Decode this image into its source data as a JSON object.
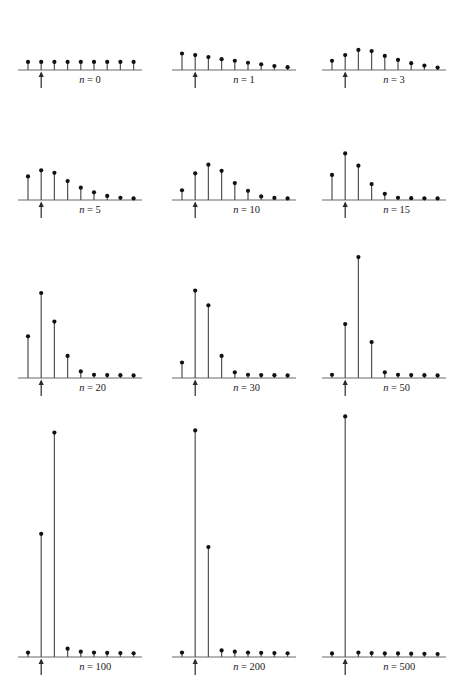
{
  "figure": {
    "type": "stem-plot-grid",
    "rows": 4,
    "columns": 3,
    "background_color": "#ffffff",
    "stem_color": "#55555a",
    "dot_color": "#111111",
    "axis_color": "#6b6b6b",
    "arrow_color": "#2b2b2b",
    "marker_symbol": "up-arrow",
    "marker_index": 1,
    "label_template": "n = {value}"
  },
  "chart_data": {
    "type": "bar",
    "title": "",
    "xlabel": "",
    "ylabel": "",
    "grid": false,
    "legend": null,
    "shared_x_count": 9,
    "panels": [
      {
        "id": "panel-n-0",
        "label": "n = 0",
        "label_var": "n",
        "label_value": "0",
        "row": 1,
        "col": 1,
        "categories": [
          0,
          1,
          2,
          3,
          4,
          5,
          6,
          7,
          8
        ],
        "values": [
          1,
          1,
          1,
          1,
          1,
          1,
          1,
          1,
          1
        ],
        "ylim": [
          0,
          8.2
        ],
        "marker_index": 1
      },
      {
        "id": "panel-n-1",
        "label": "n = 1",
        "label_var": "n",
        "label_value": "1",
        "row": 1,
        "col": 2,
        "categories": [
          0,
          1,
          2,
          3,
          4,
          5,
          6,
          7,
          8
        ],
        "values": [
          2.05,
          1.85,
          1.6,
          1.35,
          1.15,
          0.9,
          0.7,
          0.5,
          0.35
        ],
        "ylim": [
          0,
          8.2
        ],
        "marker_index": 1
      },
      {
        "id": "panel-n-3",
        "label": "n = 3",
        "label_var": "n",
        "label_value": "3",
        "row": 1,
        "col": 3,
        "categories": [
          0,
          1,
          2,
          3,
          4,
          5,
          6,
          7,
          8
        ],
        "values": [
          1.15,
          1.85,
          2.5,
          2.35,
          1.75,
          1.25,
          0.85,
          0.55,
          0.3
        ],
        "ylim": [
          0,
          8.2
        ],
        "marker_index": 1
      },
      {
        "id": "panel-n-5",
        "label": "n = 5",
        "label_var": "n",
        "label_value": "5",
        "row": 2,
        "col": 1,
        "categories": [
          0,
          1,
          2,
          3,
          4,
          5,
          6,
          7,
          8
        ],
        "values": [
          2.3,
          2.9,
          2.65,
          1.85,
          1.2,
          0.75,
          0.4,
          0.22,
          0.15
        ],
        "ylim": [
          0,
          8.2
        ],
        "marker_index": 1
      },
      {
        "id": "panel-n-10",
        "label": "n = 10",
        "label_var": "n",
        "label_value": "10",
        "row": 2,
        "col": 2,
        "categories": [
          0,
          1,
          2,
          3,
          4,
          5,
          6,
          7,
          8
        ],
        "values": [
          0.95,
          2.6,
          3.45,
          2.85,
          1.65,
          0.9,
          0.35,
          0.2,
          0.15
        ],
        "ylim": [
          0,
          8.2
        ],
        "marker_index": 1
      },
      {
        "id": "panel-n-15",
        "label": "n = 15",
        "label_var": "n",
        "label_value": "15",
        "row": 2,
        "col": 3,
        "categories": [
          0,
          1,
          2,
          3,
          4,
          5,
          6,
          7,
          8
        ],
        "values": [
          2.45,
          4.55,
          3.35,
          1.55,
          0.6,
          0.22,
          0.18,
          0.16,
          0.15
        ],
        "ylim": [
          0,
          8.2
        ],
        "marker_index": 1
      },
      {
        "id": "panel-n-20",
        "label": "n = 20",
        "label_var": "n",
        "label_value": "20",
        "row": 3,
        "col": 1,
        "categories": [
          0,
          1,
          2,
          3,
          4,
          5,
          6,
          7,
          8
        ],
        "values": [
          2.55,
          5.2,
          3.45,
          1.35,
          0.4,
          0.2,
          0.18,
          0.17,
          0.16
        ],
        "ylim": [
          0,
          8.2
        ],
        "marker_index": 1
      },
      {
        "id": "panel-n-30",
        "label": "n = 30",
        "label_var": "n",
        "label_value": "30",
        "row": 3,
        "col": 2,
        "categories": [
          0,
          1,
          2,
          3,
          4,
          5,
          6,
          7,
          8
        ],
        "values": [
          0.95,
          5.35,
          4.45,
          1.35,
          0.35,
          0.2,
          0.18,
          0.17,
          0.16
        ],
        "ylim": [
          0,
          8.2
        ],
        "marker_index": 1
      },
      {
        "id": "panel-n-50",
        "label": "n = 50",
        "label_var": "n",
        "label_value": "50",
        "row": 3,
        "col": 3,
        "categories": [
          0,
          1,
          2,
          3,
          4,
          5,
          6,
          7,
          8
        ],
        "values": [
          0.2,
          3.3,
          7.4,
          2.2,
          0.35,
          0.2,
          0.18,
          0.17,
          0.16
        ],
        "ylim": [
          0,
          8.2
        ],
        "marker_index": 1
      },
      {
        "id": "panel-n-100",
        "label": "n = 100",
        "label_var": "n",
        "label_value": "100",
        "row": 4,
        "col": 1,
        "categories": [
          0,
          1,
          2,
          3,
          4,
          5,
          6,
          7,
          8
        ],
        "values": [
          0.2,
          5.6,
          10.2,
          0.38,
          0.24,
          0.2,
          0.19,
          0.18,
          0.17
        ],
        "ylim": [
          0,
          11.5
        ],
        "marker_index": 1
      },
      {
        "id": "panel-n-200",
        "label": "n = 200",
        "label_var": "n",
        "label_value": "200",
        "row": 4,
        "col": 2,
        "categories": [
          0,
          1,
          2,
          3,
          4,
          5,
          6,
          7,
          8
        ],
        "values": [
          0.2,
          10.3,
          5.0,
          0.3,
          0.24,
          0.2,
          0.19,
          0.18,
          0.17
        ],
        "ylim": [
          0,
          11.5
        ],
        "marker_index": 1
      },
      {
        "id": "panel-n-500",
        "label": "n = 500",
        "label_var": "n",
        "label_value": "500",
        "row": 4,
        "col": 3,
        "categories": [
          0,
          1,
          2,
          3,
          4,
          5,
          6,
          7,
          8
        ],
        "values": [
          0.2,
          13.6,
          0.25,
          0.22,
          0.2,
          0.2,
          0.19,
          0.18,
          0.17
        ],
        "ylim": [
          0,
          14.3
        ],
        "marker_index": 1
      }
    ]
  }
}
